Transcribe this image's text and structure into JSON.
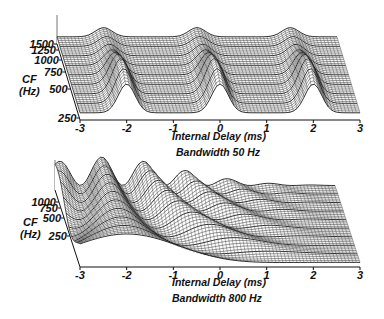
{
  "chart_data": [
    {
      "type": "surface",
      "title": "Bandwidth 50 Hz",
      "xlabel": "Internal Delay (ms)",
      "ylabel": "CF (Hz)",
      "ylabel_lines": [
        "CF",
        "(Hz)"
      ],
      "x_ticks": [
        "-3",
        "-2",
        "-1",
        "0",
        "1",
        "2",
        "3"
      ],
      "x_range": [
        -3,
        3
      ],
      "y_ticks": [
        "250",
        "500",
        "750",
        "1000",
        "1250",
        "1500"
      ],
      "y_tick_values": [
        250,
        500,
        750,
        1000,
        1250,
        1500
      ],
      "y_range": [
        250,
        1500
      ],
      "bandwidth_hz": 50,
      "center_frequency_hz": 500,
      "peak_delays_ms": [
        -2,
        0,
        2
      ],
      "description": "Cross-correlation surface with narrow-band periodic peaks at multiples of 2 ms, height largest near CF 500 Hz"
    },
    {
      "type": "surface",
      "title": "Bandwidth 800 Hz",
      "xlabel": "Internal Delay (ms)",
      "ylabel": "CF (Hz)",
      "ylabel_lines": [
        "CF",
        "(Hz)"
      ],
      "x_ticks": [
        "-3",
        "-2",
        "-1",
        "0",
        "1",
        "2",
        "3"
      ],
      "x_range": [
        -3,
        3
      ],
      "y_ticks": [
        "250",
        "500",
        "750",
        "1000"
      ],
      "y_tick_values": [
        250,
        500,
        750,
        1000
      ],
      "y_range": [
        150,
        1100
      ],
      "bandwidth_hz": 800,
      "main_peak_delay_ms": -2,
      "description": "Broadband cross-correlation surface; peak position at each CF follows a curved trajectory, dominant ridge near -2 ms"
    }
  ]
}
